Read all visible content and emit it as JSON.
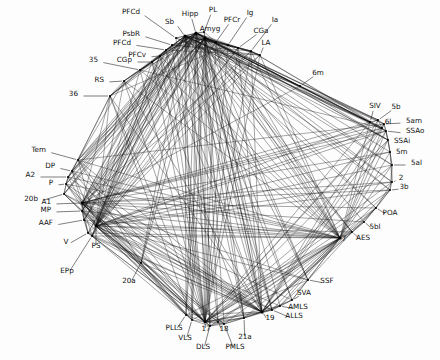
{
  "figure": {
    "name": "cat-cortical-connectivity-network",
    "background_color": "#fdfdfd",
    "edge_color": "#111111",
    "node_color": "#000000",
    "label_color": "#111111"
  },
  "chart_data": {
    "type": "scatter",
    "title": "",
    "subtitle": "",
    "xlabel": "",
    "ylabel": "",
    "xlim": [
      0,
      440
    ],
    "ylim": [
      0,
      360
    ],
    "grid": false,
    "legend": null,
    "node_count": 52,
    "edge_count": 412,
    "nodes": [
      {
        "id": "PFCd1",
        "label": "PFCd",
        "x": 176,
        "y": 38,
        "lx": 140,
        "ly": 14,
        "anchor": "end"
      },
      {
        "id": "Sb",
        "label": "Sb",
        "x": 185,
        "y": 36,
        "lx": 174,
        "ly": 24,
        "anchor": "end"
      },
      {
        "id": "Hipp",
        "label": "Hipp",
        "x": 196,
        "y": 33,
        "lx": 190,
        "ly": 16,
        "anchor": "mid"
      },
      {
        "id": "PL",
        "label": "PL",
        "x": 204,
        "y": 32,
        "lx": 213,
        "ly": 12,
        "anchor": "mid"
      },
      {
        "id": "Amyg",
        "label": "Amyg",
        "x": 205,
        "y": 38,
        "lx": 210,
        "ly": 31,
        "anchor": "mid"
      },
      {
        "id": "PFCr",
        "label": "PFCr",
        "x": 216,
        "y": 42,
        "lx": 232,
        "ly": 22,
        "anchor": "mid"
      },
      {
        "id": "Ig",
        "label": "Ig",
        "x": 228,
        "y": 45,
        "lx": 250,
        "ly": 15,
        "anchor": "mid"
      },
      {
        "id": "CGa",
        "label": "CGa",
        "x": 238,
        "y": 48,
        "lx": 261,
        "ly": 33,
        "anchor": "mid"
      },
      {
        "id": "Ia",
        "label": "Ia",
        "x": 251,
        "y": 51,
        "lx": 275,
        "ly": 22,
        "anchor": "mid"
      },
      {
        "id": "LA",
        "label": "LA",
        "x": 260,
        "y": 55,
        "lx": 266,
        "ly": 45,
        "anchor": "mid"
      },
      {
        "id": "PsbR",
        "label": "PsbR",
        "x": 172,
        "y": 45,
        "lx": 140,
        "ly": 36,
        "anchor": "end"
      },
      {
        "id": "PFCd2",
        "label": "PFCd",
        "x": 166,
        "y": 50,
        "lx": 131,
        "ly": 45,
        "anchor": "end"
      },
      {
        "id": "PFCv",
        "label": "PFCv",
        "x": 160,
        "y": 56,
        "lx": 146,
        "ly": 57,
        "anchor": "end"
      },
      {
        "id": "CGp",
        "label": "CGp",
        "x": 152,
        "y": 62,
        "lx": 132,
        "ly": 62,
        "anchor": "end"
      },
      {
        "id": "n35",
        "label": "35",
        "x": 140,
        "y": 70,
        "lx": 98,
        "ly": 62,
        "anchor": "end"
      },
      {
        "id": "RS",
        "label": "RS",
        "x": 124,
        "y": 81,
        "lx": 104,
        "ly": 82,
        "anchor": "end"
      },
      {
        "id": "n36",
        "label": "36",
        "x": 110,
        "y": 96,
        "lx": 78,
        "ly": 96,
        "anchor": "end"
      },
      {
        "id": "Tem",
        "label": "Tem",
        "x": 78,
        "y": 160,
        "lx": 46,
        "ly": 152,
        "anchor": "end"
      },
      {
        "id": "DP",
        "label": "DP",
        "x": 72,
        "y": 171,
        "lx": 55,
        "ly": 168,
        "anchor": "end"
      },
      {
        "id": "A2",
        "label": "A2",
        "x": 68,
        "y": 177,
        "lx": 35,
        "ly": 177,
        "anchor": "end"
      },
      {
        "id": "P",
        "label": "P",
        "x": 66,
        "y": 184,
        "lx": 53,
        "ly": 185,
        "anchor": "end"
      },
      {
        "id": "n20b",
        "label": "20b",
        "x": 64,
        "y": 194,
        "lx": 38,
        "ly": 201,
        "anchor": "end"
      },
      {
        "id": "A1",
        "label": "A1",
        "x": 82,
        "y": 203,
        "lx": 51,
        "ly": 204,
        "anchor": "end"
      },
      {
        "id": "MP",
        "label": "MP",
        "x": 82,
        "y": 211,
        "lx": 51,
        "ly": 212,
        "anchor": "end"
      },
      {
        "id": "AAF",
        "label": "AAF",
        "x": 84,
        "y": 220,
        "lx": 53,
        "ly": 225,
        "anchor": "end"
      },
      {
        "id": "V",
        "label": "V",
        "x": 88,
        "y": 233,
        "lx": 66,
        "ly": 244,
        "anchor": "mid"
      },
      {
        "id": "PS",
        "label": "PS",
        "x": 96,
        "y": 226,
        "lx": 96,
        "ly": 248,
        "anchor": "mid"
      },
      {
        "id": "EPp",
        "label": "EPp",
        "x": 92,
        "y": 236,
        "lx": 67,
        "ly": 273,
        "anchor": "mid"
      },
      {
        "id": "n20a",
        "label": "20a",
        "x": 141,
        "y": 263,
        "lx": 129,
        "ly": 283,
        "anchor": "mid"
      },
      {
        "id": "PLLS",
        "label": "PLLS",
        "x": 186,
        "y": 315,
        "lx": 174,
        "ly": 330,
        "anchor": "mid"
      },
      {
        "id": "VLS",
        "label": "VLS",
        "x": 192,
        "y": 320,
        "lx": 185,
        "ly": 340,
        "anchor": "mid"
      },
      {
        "id": "n17",
        "label": "17",
        "x": 205,
        "y": 322,
        "lx": 206,
        "ly": 331,
        "anchor": "mid"
      },
      {
        "id": "DLS",
        "label": "DLS",
        "x": 210,
        "y": 326,
        "lx": 203,
        "ly": 349,
        "anchor": "mid"
      },
      {
        "id": "n18",
        "label": "18",
        "x": 218,
        "y": 322,
        "lx": 224,
        "ly": 331,
        "anchor": "mid"
      },
      {
        "id": "PMLS",
        "label": "PMLS",
        "x": 224,
        "y": 324,
        "lx": 235,
        "ly": 349,
        "anchor": "mid"
      },
      {
        "id": "n21a",
        "label": "21a",
        "x": 244,
        "y": 318,
        "lx": 245,
        "ly": 339,
        "anchor": "mid"
      },
      {
        "id": "n19",
        "label": "19",
        "x": 262,
        "y": 312,
        "lx": 270,
        "ly": 320,
        "anchor": "mid"
      },
      {
        "id": "ALLS",
        "label": "ALLS",
        "x": 272,
        "y": 310,
        "lx": 294,
        "ly": 318,
        "anchor": "mid"
      },
      {
        "id": "AMLS",
        "label": "AMLS",
        "x": 280,
        "y": 306,
        "lx": 298,
        "ly": 309,
        "anchor": "mid"
      },
      {
        "id": "SVA",
        "label": "SVA",
        "x": 292,
        "y": 300,
        "lx": 304,
        "ly": 295,
        "anchor": "mid"
      },
      {
        "id": "SSF",
        "label": "SSF",
        "x": 308,
        "y": 280,
        "lx": 327,
        "ly": 283,
        "anchor": "mid"
      },
      {
        "id": "n7",
        "label": "7",
        "x": 340,
        "y": 238,
        "lx": 344,
        "ly": 241,
        "anchor": "mid"
      },
      {
        "id": "AES",
        "label": "AES",
        "x": 352,
        "y": 232,
        "lx": 363,
        "ly": 240,
        "anchor": "mid"
      },
      {
        "id": "n5bl",
        "label": "5bl",
        "x": 364,
        "y": 222,
        "lx": 375,
        "ly": 229,
        "anchor": "mid"
      },
      {
        "id": "POA",
        "label": "POA",
        "x": 376,
        "y": 208,
        "lx": 390,
        "ly": 215,
        "anchor": "mid"
      },
      {
        "id": "n3b",
        "label": "3b",
        "x": 390,
        "y": 190,
        "lx": 404,
        "ly": 189,
        "anchor": "mid"
      },
      {
        "id": "n2",
        "label": "2",
        "x": 392,
        "y": 182,
        "lx": 401,
        "ly": 180,
        "anchor": "mid"
      },
      {
        "id": "n5al",
        "label": "5al",
        "x": 392,
        "y": 165,
        "lx": 411,
        "ly": 165,
        "anchor": "start"
      },
      {
        "id": "n5m",
        "label": "5m",
        "x": 390,
        "y": 152,
        "lx": 396,
        "ly": 154,
        "anchor": "start"
      },
      {
        "id": "SSAi",
        "label": "SSAi",
        "x": 388,
        "y": 140,
        "lx": 394,
        "ly": 143,
        "anchor": "start"
      },
      {
        "id": "SSAo",
        "label": "SSAo",
        "x": 386,
        "y": 131,
        "lx": 406,
        "ly": 133,
        "anchor": "start"
      },
      {
        "id": "n5am",
        "label": "5am",
        "x": 384,
        "y": 124,
        "lx": 406,
        "ly": 123,
        "anchor": "start"
      },
      {
        "id": "n6l",
        "label": "6l",
        "x": 382,
        "y": 128,
        "lx": 388,
        "ly": 124,
        "anchor": "mid"
      },
      {
        "id": "n5b",
        "label": "5b",
        "x": 378,
        "y": 120,
        "lx": 396,
        "ly": 109,
        "anchor": "mid"
      },
      {
        "id": "SIV",
        "label": "SIV",
        "x": 370,
        "y": 122,
        "lx": 375,
        "ly": 108,
        "anchor": "mid"
      },
      {
        "id": "n6m",
        "label": "6m",
        "x": 300,
        "y": 86,
        "lx": 318,
        "ly": 75,
        "anchor": "mid"
      }
    ],
    "hub_nodes": [
      "Sb",
      "Hipp",
      "Amyg",
      "n17",
      "n19",
      "n7",
      "A1",
      "PS"
    ],
    "values": []
  }
}
